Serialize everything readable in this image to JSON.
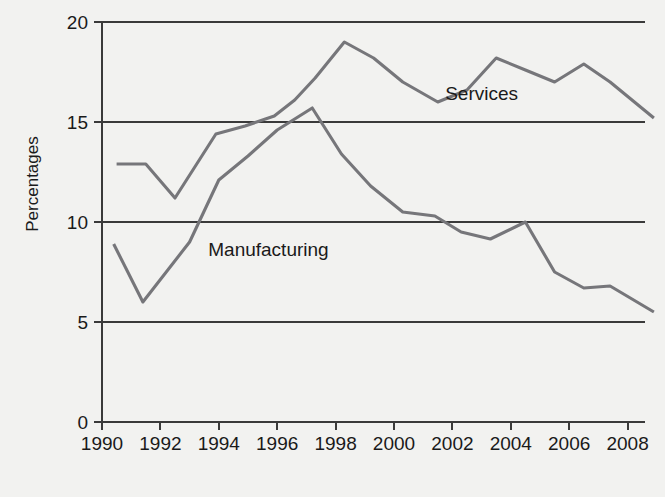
{
  "chart_data": {
    "type": "line",
    "title": "",
    "xlabel": "",
    "ylabel": "Percentages",
    "xlim": [
      1990,
      2009
    ],
    "ylim": [
      0,
      20
    ],
    "grid": true,
    "grid_axis": "y",
    "legend": "inline-annotations",
    "x_ticks": [
      "1990",
      "1992",
      "1994",
      "1996",
      "1998",
      "2000",
      "2002",
      "2004",
      "2006",
      "2008"
    ],
    "x_tick_values": [
      1990,
      1992,
      1994,
      1996,
      1998,
      2000,
      2002,
      2004,
      2006,
      2008
    ],
    "y_ticks": [
      "0",
      "5",
      "10",
      "15",
      "20"
    ],
    "y_tick_values": [
      0,
      5,
      10,
      15,
      20
    ],
    "line_color": "#76767a",
    "axis_color": "#3a3a3a",
    "background": "#f2f2f0",
    "series": [
      {
        "name": "Services",
        "label": "Services",
        "label_x": 2003.0,
        "label_y": 16.1,
        "x": [
          1990.5,
          1991.5,
          1992.5,
          1993.9,
          1994.9,
          1995.9,
          1996.6,
          1997.3,
          1998.3,
          1999.3,
          2000.3,
          2001.5,
          2002.5,
          2003.5,
          2004.5,
          2005.5,
          2006.5,
          2007.4,
          2008.9
        ],
        "values": [
          12.9,
          12.9,
          11.2,
          14.4,
          14.8,
          15.3,
          16.1,
          17.2,
          19.0,
          18.2,
          17.0,
          16.0,
          16.6,
          18.2,
          17.6,
          17.0,
          17.9,
          17.0,
          15.2
        ]
      },
      {
        "name": "Manufacturing",
        "label": "Manufacturing",
        "label_x": 1995.7,
        "label_y": 8.3,
        "x": [
          1990.4,
          1991.4,
          1993.0,
          1994.0,
          1995.0,
          1996.0,
          1997.2,
          1998.2,
          1999.2,
          2000.3,
          2001.4,
          2002.3,
          2003.3,
          2004.5,
          2005.5,
          2006.5,
          2007.4,
          2008.9
        ],
        "values": [
          8.9,
          6.0,
          9.0,
          12.1,
          13.3,
          14.6,
          15.7,
          13.4,
          11.8,
          10.5,
          10.3,
          9.5,
          9.15,
          10.0,
          7.5,
          6.7,
          6.8,
          5.5
        ]
      }
    ]
  },
  "axis": {
    "y_title": "Percentages"
  }
}
